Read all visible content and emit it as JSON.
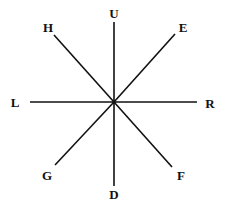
{
  "diagram": {
    "type": "direction-star",
    "center": {
      "x": 114,
      "y": 102
    },
    "labels": {
      "up": "U",
      "down": "D",
      "left": "L",
      "right": "R",
      "upper_left": "H",
      "upper_right": "E",
      "lower_left": "G",
      "lower_right": "F"
    },
    "line_color": "#111111",
    "background": "#ffffff"
  }
}
